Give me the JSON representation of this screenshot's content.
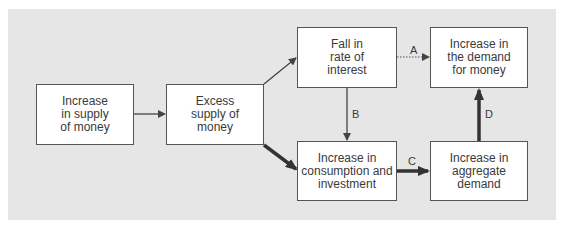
{
  "diagram": {
    "nodes": [
      {
        "id": "increase-supply",
        "label": "Increase\nin supply\nof money"
      },
      {
        "id": "excess-supply",
        "label": "Excess\nsupply of\nmoney"
      },
      {
        "id": "fall-interest",
        "label": "Fall in\nrate of\ninterest"
      },
      {
        "id": "increase-demand-money",
        "label": "Increase in\nthe demand\nfor money"
      },
      {
        "id": "increase-consumption",
        "label": "Increase in\nconsumption and\ninvestment"
      },
      {
        "id": "increase-aggregate",
        "label": "Increase in\naggregate\ndemand"
      }
    ],
    "edges": [
      {
        "from": "increase-supply",
        "to": "excess-supply",
        "label": "",
        "style": "thin"
      },
      {
        "from": "excess-supply",
        "to": "fall-interest",
        "label": "",
        "style": "thin"
      },
      {
        "from": "excess-supply",
        "to": "increase-consumption",
        "label": "",
        "style": "thick"
      },
      {
        "from": "fall-interest",
        "to": "increase-demand-money",
        "label": "A",
        "style": "dotted"
      },
      {
        "from": "fall-interest",
        "to": "increase-consumption",
        "label": "B",
        "style": "thin"
      },
      {
        "from": "increase-consumption",
        "to": "increase-aggregate",
        "label": "C",
        "style": "thick"
      },
      {
        "from": "increase-aggregate",
        "to": "increase-demand-money",
        "label": "D",
        "style": "thick"
      }
    ]
  },
  "colors": {
    "panel": "#e6e6e6",
    "box": "#ffffff",
    "stroke": "#444444"
  }
}
